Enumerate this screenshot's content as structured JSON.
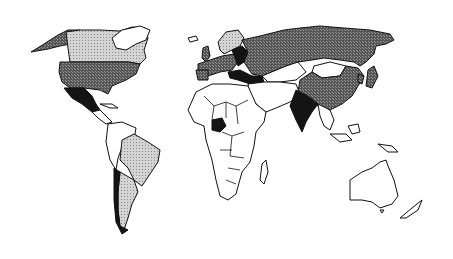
{
  "map": {
    "type": "world-choropleth",
    "projection": "equirectangular-like",
    "legend_visible": false,
    "title_visible": false,
    "categories": [
      {
        "id": "black",
        "shade": "solid black",
        "color": "#141414"
      },
      {
        "id": "dark",
        "shade": "dark gray dither",
        "color": "#6a6a6a"
      },
      {
        "id": "light",
        "shade": "light gray dots",
        "color": "#c8c8c8"
      },
      {
        "id": "white",
        "shade": "white / no fill",
        "color": "#ffffff"
      }
    ],
    "regions": [
      {
        "name": "Alaska",
        "category": "dark"
      },
      {
        "name": "Canada",
        "category": "light"
      },
      {
        "name": "Greenland",
        "category": "white"
      },
      {
        "name": "United States",
        "category": "dark"
      },
      {
        "name": "Mexico",
        "category": "black"
      },
      {
        "name": "Central America & Caribbean",
        "category": "white"
      },
      {
        "name": "Northern South America",
        "category": "white"
      },
      {
        "name": "Brazil",
        "category": "light"
      },
      {
        "name": "Argentina",
        "category": "light"
      },
      {
        "name": "Chile",
        "category": "black"
      },
      {
        "name": "Scandinavia",
        "category": "light"
      },
      {
        "name": "Western Europe",
        "category": "dark"
      },
      {
        "name": "Eastern Europe / Turkey",
        "category": "black"
      },
      {
        "name": "Russia",
        "category": "dark"
      },
      {
        "name": "China",
        "category": "dark"
      },
      {
        "name": "Mongolia",
        "category": "white"
      },
      {
        "name": "India",
        "category": "black"
      },
      {
        "name": "Nigeria",
        "category": "black"
      },
      {
        "name": "Africa (other)",
        "category": "white"
      },
      {
        "name": "Middle East",
        "category": "white"
      },
      {
        "name": "Southeast Asia",
        "category": "white"
      },
      {
        "name": "Japan",
        "category": "dark"
      },
      {
        "name": "Australia",
        "category": "white"
      },
      {
        "name": "New Zealand",
        "category": "white"
      },
      {
        "name": "Madagascar",
        "category": "white"
      }
    ]
  }
}
